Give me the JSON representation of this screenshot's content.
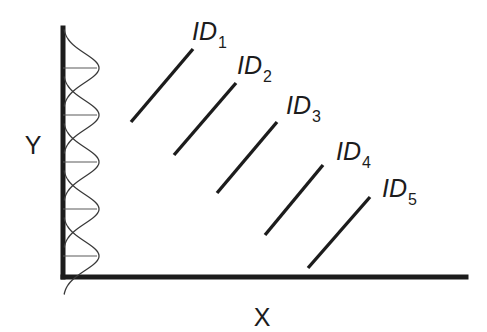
{
  "figure": {
    "background_color": "#ffffff",
    "line_color": "#1c1c1c",
    "curve_color": "#3a3a3a",
    "width": 487,
    "height": 332
  },
  "axes": {
    "y_label": "Y",
    "x_label": "X",
    "y_label_x": 33,
    "y_label_y": 147,
    "x_label_x": 262,
    "x_label_y": 319,
    "origin_x": 63,
    "origin_y": 277,
    "y_top": 28,
    "x_right": 466
  },
  "distributions": {
    "count": 5,
    "axis_x": 63,
    "peak_width": 36,
    "centers_y": [
      68,
      115,
      162,
      209,
      256
    ],
    "half_span": 38,
    "baseline_length": 34,
    "label": "gaussian-distribution-along-y-axis"
  },
  "id_series": [
    {
      "id": "ID1",
      "label_main": "ID",
      "label_sub": "1",
      "x1": 131,
      "y1": 122,
      "x2": 193,
      "y2": 49,
      "label_x": 192,
      "label_y": 40
    },
    {
      "id": "ID2",
      "label_main": "ID",
      "label_sub": "2",
      "x1": 174,
      "y1": 155,
      "x2": 236,
      "y2": 83,
      "label_x": 237,
      "label_y": 74
    },
    {
      "id": "ID3",
      "label_main": "ID",
      "label_sub": "3",
      "x1": 217,
      "y1": 193,
      "x2": 277,
      "y2": 122,
      "label_x": 286,
      "label_y": 114
    },
    {
      "id": "ID4",
      "label_main": "ID",
      "label_sub": "4",
      "x1": 265,
      "y1": 235,
      "x2": 323,
      "y2": 165,
      "label_x": 336,
      "label_y": 160
    },
    {
      "id": "ID5",
      "label_main": "ID",
      "label_sub": "5",
      "x1": 308,
      "y1": 268,
      "x2": 370,
      "y2": 197,
      "label_x": 382,
      "label_y": 197
    }
  ],
  "chart_data": {
    "type": "line",
    "title": "",
    "xlabel": "X",
    "ylabel": "Y",
    "grid": false,
    "legend": "inline-end-labels",
    "note": "Schematic diagram: five parallel ascending line segments arranged in a descending staircase, each annotated ID1..ID5; the Y axis carries five overlapping sideways Gaussian distribution curves with horizontal baselines.",
    "series": [
      {
        "name": "ID1",
        "x": [
          131,
          193
        ],
        "y": [
          122,
          49
        ]
      },
      {
        "name": "ID2",
        "x": [
          174,
          236
        ],
        "y": [
          155,
          83
        ]
      },
      {
        "name": "ID3",
        "x": [
          217,
          277
        ],
        "y": [
          193,
          122
        ]
      },
      {
        "name": "ID4",
        "x": [
          265,
          323
        ],
        "y": [
          235,
          165
        ]
      },
      {
        "name": "ID5",
        "x": [
          308,
          370
        ],
        "y": [
          268,
          197
        ]
      }
    ],
    "y_axis_distributions": {
      "type": "gaussian",
      "count": 5,
      "centers": [
        68,
        115,
        162,
        209,
        256
      ],
      "peak_amplitude": 36,
      "orientation": "horizontal-from-y-axis"
    }
  }
}
